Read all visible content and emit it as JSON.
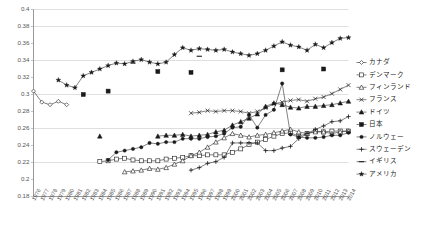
{
  "chart_data": {
    "type": "line",
    "title": "",
    "xlabel": "",
    "ylabel": "",
    "ylim": [
      0.18,
      0.4
    ],
    "ytick_step": 0.02,
    "yticks": [
      "0.4",
      "0.38",
      "0.36",
      "0.34",
      "0.32",
      "0.3",
      "0.28",
      "0.26",
      "0.24",
      "0.22",
      "0.2",
      "0.18"
    ],
    "gridlines": [
      0.38,
      0.34,
      0.3,
      0.26,
      0.22
    ],
    "grid": true,
    "legend_position": "right",
    "x": [
      1976,
      1977,
      1978,
      1979,
      1980,
      1981,
      1982,
      1983,
      1984,
      1985,
      1986,
      1987,
      1988,
      1989,
      1990,
      1991,
      1992,
      1993,
      1994,
      1995,
      1996,
      1997,
      1998,
      1999,
      2000,
      2001,
      2002,
      2003,
      2004,
      2005,
      2006,
      2007,
      2008,
      2009,
      2010,
      2011,
      2012,
      2013,
      2014
    ],
    "xticks": [
      "1976",
      "1977",
      "1978",
      "1979",
      "1980",
      "1981",
      "1982",
      "1983",
      "1984",
      "1985",
      "1986",
      "1987",
      "1988",
      "1989",
      "1990",
      "1991",
      "1992",
      "1993",
      "1994",
      "1995",
      "1996",
      "1997",
      "1998",
      "1999",
      "2000",
      "2001",
      "2002",
      "2003",
      "2004",
      "2005",
      "2006",
      "2007",
      "2008",
      "2009",
      "2010",
      "2011",
      "2012",
      "2013",
      "2014"
    ],
    "series": [
      {
        "name": "カナダ",
        "marker": "diamond-open",
        "connected": true,
        "values": [
          0.304,
          0.291,
          0.288,
          0.292,
          0.288,
          null,
          null,
          null,
          null,
          null,
          null,
          null,
          null,
          null,
          null,
          null,
          null,
          null,
          null,
          null,
          null,
          null,
          null,
          null,
          null,
          null,
          null,
          null,
          null,
          null,
          null,
          null,
          null,
          null,
          null,
          null,
          null,
          null,
          null
        ]
      },
      {
        "name": "デンマーク",
        "marker": "square-open",
        "connected": true,
        "values": [
          null,
          null,
          null,
          null,
          null,
          null,
          null,
          null,
          0.221,
          0.222,
          0.224,
          0.225,
          0.223,
          0.222,
          0.222,
          0.222,
          0.224,
          0.225,
          0.226,
          0.228,
          0.228,
          0.229,
          0.229,
          0.229,
          0.232,
          0.236,
          0.241,
          0.244,
          0.247,
          0.251,
          0.254,
          0.255,
          0.251,
          0.254,
          0.257,
          0.256,
          0.257,
          0.257,
          0.257
        ]
      },
      {
        "name": "フィンランド",
        "marker": "triangle-open",
        "connected": true,
        "values": [
          null,
          null,
          null,
          null,
          null,
          null,
          null,
          null,
          null,
          null,
          null,
          0.209,
          0.21,
          0.211,
          0.213,
          0.212,
          0.214,
          0.218,
          0.222,
          0.228,
          0.232,
          0.238,
          0.244,
          0.249,
          0.254,
          0.252,
          0.25,
          0.252,
          0.253,
          0.255,
          0.257,
          0.259,
          0.256,
          0.254,
          0.256,
          0.256,
          0.254,
          0.256,
          0.257
        ]
      },
      {
        "name": "フランス",
        "marker": "x",
        "connected": true,
        "values": [
          null,
          null,
          null,
          null,
          null,
          null,
          null,
          null,
          null,
          null,
          null,
          null,
          null,
          null,
          null,
          null,
          null,
          null,
          null,
          0.278,
          0.279,
          0.281,
          0.28,
          0.281,
          0.281,
          0.28,
          0.278,
          0.28,
          0.284,
          0.289,
          0.291,
          0.293,
          0.294,
          0.292,
          0.295,
          0.297,
          0.301,
          0.306,
          0.311
        ]
      },
      {
        "name": "ドイツ",
        "marker": "triangle-filled",
        "connected": true,
        "values": [
          null,
          null,
          null,
          null,
          null,
          null,
          null,
          null,
          0.251,
          null,
          null,
          null,
          null,
          null,
          null,
          0.251,
          0.252,
          0.252,
          0.253,
          0.251,
          0.252,
          0.253,
          0.256,
          0.258,
          0.264,
          0.268,
          0.272,
          0.277,
          0.286,
          0.29,
          0.288,
          0.285,
          0.284,
          0.286,
          0.286,
          0.287,
          0.288,
          0.29,
          0.292
        ]
      },
      {
        "name": "日本",
        "marker": "square-filled",
        "connected": false,
        "values": [
          null,
          null,
          null,
          null,
          null,
          null,
          0.3,
          null,
          null,
          0.304,
          null,
          null,
          null,
          null,
          null,
          0.327,
          null,
          null,
          null,
          0.326,
          null,
          null,
          null,
          null,
          null,
          null,
          null,
          null,
          null,
          null,
          0.329,
          null,
          null,
          null,
          null,
          0.33,
          null,
          null,
          null
        ]
      },
      {
        "name": "ノルウェー",
        "marker": "circle-filled",
        "connected": true,
        "values": [
          null,
          null,
          null,
          null,
          null,
          null,
          null,
          null,
          null,
          0.223,
          0.232,
          0.234,
          0.236,
          0.238,
          0.243,
          0.242,
          0.244,
          0.244,
          0.248,
          0.248,
          0.248,
          0.25,
          0.251,
          0.254,
          0.261,
          0.262,
          0.276,
          0.261,
          0.276,
          0.282,
          0.313,
          0.253,
          0.25,
          0.249,
          0.249,
          0.25,
          0.252,
          0.252,
          0.255
        ]
      },
      {
        "name": "スウェーデン",
        "marker": "plus",
        "connected": true,
        "values": [
          null,
          null,
          null,
          null,
          null,
          null,
          null,
          null,
          null,
          null,
          null,
          null,
          null,
          null,
          null,
          null,
          null,
          null,
          null,
          0.211,
          0.214,
          0.219,
          0.221,
          0.226,
          0.243,
          0.243,
          0.243,
          0.243,
          0.234,
          0.234,
          0.237,
          0.239,
          0.248,
          0.254,
          0.259,
          0.263,
          0.268,
          0.269,
          0.274
        ]
      },
      {
        "name": "イギリス",
        "marker": "dash",
        "connected": false,
        "values": [
          null,
          null,
          null,
          null,
          null,
          null,
          null,
          null,
          null,
          null,
          null,
          null,
          0.337,
          null,
          null,
          null,
          null,
          null,
          null,
          null,
          0.345,
          null,
          null,
          null,
          null,
          null,
          null,
          null,
          null,
          null,
          null,
          null,
          null,
          null,
          null,
          null,
          null,
          null,
          null
        ]
      },
      {
        "name": "アメリカ",
        "marker": "star",
        "connected": true,
        "values": [
          null,
          null,
          null,
          0.317,
          0.311,
          0.308,
          0.322,
          0.326,
          0.33,
          0.334,
          0.337,
          0.336,
          0.339,
          0.341,
          0.338,
          0.336,
          0.338,
          0.347,
          0.355,
          0.352,
          0.354,
          0.353,
          0.352,
          0.353,
          0.35,
          0.348,
          0.346,
          0.348,
          0.352,
          0.357,
          0.362,
          0.358,
          0.356,
          0.352,
          0.359,
          0.355,
          0.361,
          0.366,
          0.367
        ]
      }
    ]
  },
  "legend": {
    "items": [
      {
        "label": "カナダ",
        "marker": "diamond-open"
      },
      {
        "label": "デンマーク",
        "marker": "square-open"
      },
      {
        "label": "フィンランド",
        "marker": "triangle-open"
      },
      {
        "label": "フランス",
        "marker": "x"
      },
      {
        "label": "ドイツ",
        "marker": "triangle-filled"
      },
      {
        "label": "日本",
        "marker": "square-filled"
      },
      {
        "label": "ノルウェー",
        "marker": "circle-filled"
      },
      {
        "label": "スウェーデン",
        "marker": "plus"
      },
      {
        "label": "イギリス",
        "marker": "dash"
      },
      {
        "label": "アメリカ",
        "marker": "star"
      }
    ]
  },
  "colors": {
    "ink": "#1a1a1a",
    "axis": "#9a9a9a",
    "grid": "#c9c9c9",
    "tick_text": "#555555",
    "background": "#ffffff"
  }
}
